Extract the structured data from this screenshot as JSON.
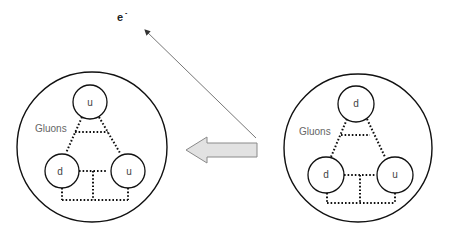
{
  "diagram": {
    "type": "beta-decay-quark-diagram",
    "electron": {
      "label": "e",
      "superscript": "-"
    },
    "left_particle": {
      "role": "result",
      "gluon_label": "Gluons",
      "quarks": [
        {
          "position": "top",
          "label": "u"
        },
        {
          "position": "bottom-left",
          "label": "d"
        },
        {
          "position": "bottom-right",
          "label": "u"
        }
      ]
    },
    "right_particle": {
      "role": "initial",
      "gluon_label": "Gluons",
      "quarks": [
        {
          "position": "top",
          "label": "d"
        },
        {
          "position": "bottom-left",
          "label": "d"
        },
        {
          "position": "bottom-right",
          "label": "u"
        }
      ]
    },
    "transition_arrow": {
      "direction": "left",
      "fill": "#e2e2e2",
      "stroke": "#8a8a8a"
    },
    "colors": {
      "line": "#111111",
      "electron_path": "#666666",
      "text": "#555555"
    }
  }
}
